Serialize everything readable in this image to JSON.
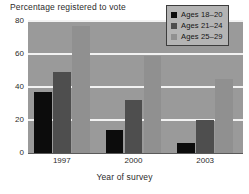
{
  "chart_data": {
    "type": "bar",
    "title": "Percentage registered to vote",
    "xlabel": "Year of survey",
    "ylabel": "",
    "categories": [
      "1997",
      "2000",
      "2003"
    ],
    "series": [
      {
        "name": "Ages 18–20",
        "color": "#0c0c0c",
        "values": [
          37,
          14,
          6
        ]
      },
      {
        "name": "Ages 21–24",
        "color": "#4e4e4e",
        "values": [
          49,
          32,
          20
        ]
      },
      {
        "name": "Ages 25–29",
        "color": "#909090",
        "values": [
          77,
          59,
          45
        ]
      }
    ],
    "ylim": [
      0,
      80
    ],
    "yticks": [
      "0",
      "20",
      "40",
      "60",
      "80"
    ],
    "grid": true,
    "legend_position": "top-right",
    "plot_background": "#9a9a9a",
    "gridline_color": "#f2f2f2"
  },
  "legend": {
    "items": [
      {
        "label": "Ages 18–20"
      },
      {
        "label": "Ages 21–24"
      },
      {
        "label": "Ages 25–29"
      }
    ]
  },
  "caption": {
    "partial_text": ""
  }
}
